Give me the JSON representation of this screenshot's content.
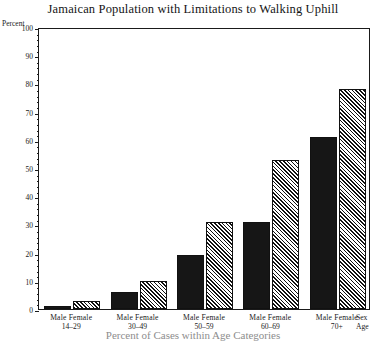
{
  "chart_data": {
    "type": "bar",
    "title": "Jamaican Population with Limitations to Walking Uphill",
    "caption": "Percent of Cases within Age Categories",
    "xlabel": "",
    "ylabel": "Percent",
    "ylim": [
      0,
      100
    ],
    "ytick_step": 10,
    "yminor_step": 2,
    "grid": false,
    "legend_position": "none",
    "categories": [
      "14–29",
      "30–49",
      "50–59",
      "60–69",
      "70+"
    ],
    "series": [
      {
        "name": "Male",
        "values": [
          1,
          6,
          19,
          31,
          61
        ]
      },
      {
        "name": "Female",
        "values": [
          3,
          10,
          31,
          53,
          78
        ]
      }
    ],
    "ytick_labels": [
      "0",
      "10",
      "20",
      "30",
      "40",
      "50",
      "60",
      "70",
      "80",
      "90",
      "100"
    ],
    "axis_key": {
      "sex": "Sex",
      "age": "Age"
    },
    "group_label": "Male Female",
    "colors": {
      "male_bar": "#161616",
      "female_hatch": "#111111",
      "axis": "#1a1a1a",
      "background": "#ffffff"
    }
  }
}
